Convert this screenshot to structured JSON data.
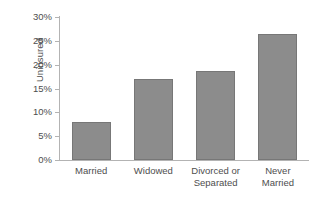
{
  "chart_data": {
    "type": "bar",
    "title": "",
    "xlabel": "",
    "ylabel": "Uninsured",
    "categories": [
      "Married",
      "Widowed",
      "Divorced or Separated",
      "Never Married"
    ],
    "category_lines": [
      [
        "Married"
      ],
      [
        "Widowed"
      ],
      [
        "Divorced or",
        "Separated"
      ],
      [
        "Never",
        "Married"
      ]
    ],
    "values": [
      8.0,
      16.9,
      18.6,
      26.4
    ],
    "value_labels": [
      "8%",
      "16.9%",
      "18.6%",
      "26.4%"
    ],
    "ylim": [
      0,
      30
    ],
    "ytick_values": [
      30,
      25,
      20,
      15,
      10,
      5,
      0
    ],
    "ytick_labels": [
      "30%",
      "25%",
      "20%",
      "15%",
      "10%",
      "5%",
      "0%"
    ],
    "grid": false,
    "legend": "none",
    "bar_color": "#8c8c8c",
    "bar_border_color": "#777777",
    "axis_color": "#b3b3b3",
    "text_color": "#4e4e4e",
    "background_color": "#ffffff"
  }
}
